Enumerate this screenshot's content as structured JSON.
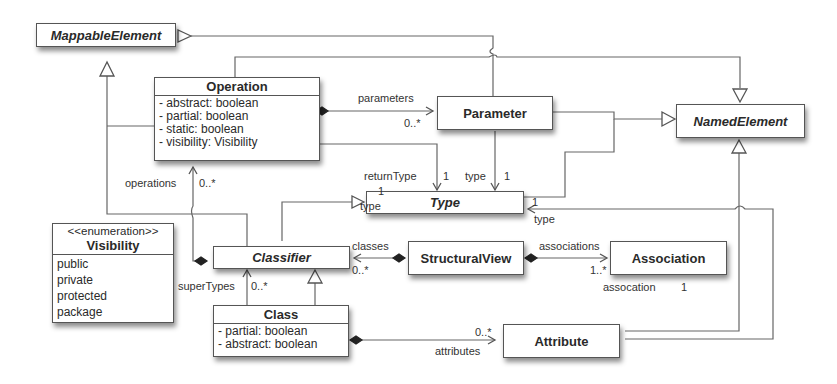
{
  "diagram": {
    "type": "uml-class-diagram",
    "classes": {
      "mappable_element": {
        "name": "MappableElement",
        "abstract": true
      },
      "named_element": {
        "name": "NamedElement",
        "abstract": true
      },
      "operation": {
        "name": "Operation",
        "attributes": [
          "- abstract: boolean",
          "- partial: boolean",
          "- static: boolean",
          "- visibility: Visibility"
        ]
      },
      "parameter": {
        "name": "Parameter"
      },
      "type": {
        "name": "Type",
        "abstract": true
      },
      "classifier": {
        "name": "Classifier",
        "abstract": true
      },
      "structural_view": {
        "name": "StructuralView"
      },
      "association": {
        "name": "Association"
      },
      "class": {
        "name": "Class",
        "attributes": [
          "- partial: boolean",
          "- abstract: boolean"
        ]
      },
      "attribute": {
        "name": "Attribute"
      },
      "visibility": {
        "stereotype": "<<enumeration>>",
        "name": "Visibility",
        "literals": [
          "public",
          "private",
          "protected",
          "package"
        ]
      }
    },
    "labels": {
      "parameters": "parameters",
      "parameters_mult": "0..*",
      "return_type": "returnType",
      "return_type_mult": "1",
      "param_type": "type",
      "param_type_mult": "1",
      "operations": "operations",
      "operations_mult": "0..*",
      "classifier_type_mult": "1",
      "classifier_type": "type",
      "attr_type_mult": "1",
      "attr_type": "type",
      "classes": "classes",
      "classes_mult": "0..*",
      "associations": "associations",
      "associations_mult": "1..*",
      "association_end": "assocation",
      "association_end_mult": "1",
      "super_types": "superTypes",
      "super_types_mult": "0..*",
      "attributes_mult": "0..*",
      "attributes": "attributes"
    }
  }
}
